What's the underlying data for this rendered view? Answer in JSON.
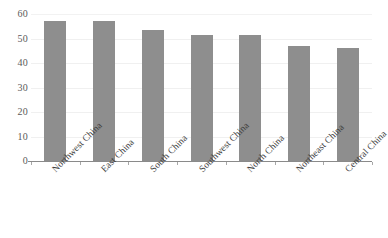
{
  "chart_data": {
    "type": "bar",
    "title": "",
    "subtitle": "",
    "xlabel": "",
    "ylabel": "",
    "categories": [
      "Northwest China",
      "East China",
      "South China",
      "Southwest China",
      "North China",
      "Northeast China",
      "Central China"
    ],
    "values": [
      57,
      57,
      53.5,
      51.5,
      51.5,
      47,
      46
    ],
    "ylim": [
      0,
      60
    ],
    "yticks": [
      0,
      10,
      20,
      30,
      40,
      50,
      60
    ],
    "ytick_labels": [
      "0",
      "10",
      "20",
      "30",
      "40",
      "50",
      "60"
    ],
    "grid": true,
    "grid_axis": "y",
    "legend": false,
    "legend_position": "none",
    "annotations": [],
    "series": [
      {
        "name": "",
        "values": [
          57,
          57,
          53.5,
          51.5,
          51.5,
          47,
          46
        ]
      }
    ]
  },
  "style": {
    "bar_color": "#8e8e8e",
    "gridline_color": "#f0f0f0",
    "axis_color": "#8a8a8a",
    "ytick_text_color": "#5a5a5a",
    "xtick_text_color": "#3d3d3d",
    "background_color": "#ffffff"
  }
}
